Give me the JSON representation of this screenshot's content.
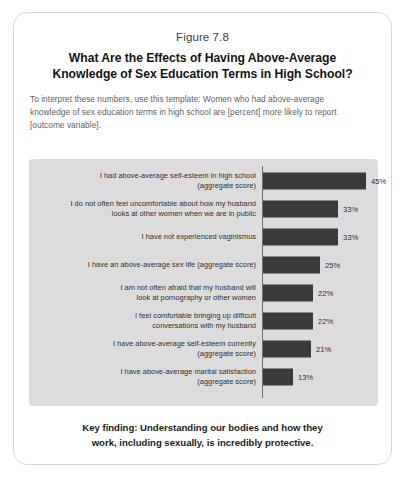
{
  "figure": {
    "number": "Figure 7.8",
    "title_lines": [
      "What Are the Effects of Having Above-Average",
      "Knowledge of Sex Education Terms in High School?"
    ],
    "description_lines": [
      "To interpret these numbers, use this template: Women who had above-average",
      "knowledge of sex education terms in high school are [percent] more likely to report",
      "[outcome variable]."
    ],
    "key_finding_lines": [
      "Key finding: Understanding our bodies and how they",
      "work, including sexually, is incredibly protective."
    ]
  },
  "colors": {
    "bar": "#3a3a3a",
    "panel_background": "#dcdcdc",
    "axis": "#6f6f6f",
    "card_border": "#d8d8d8"
  },
  "chart_data": {
    "type": "bar",
    "orientation": "horizontal",
    "title": "What Are the Effects of Having Above-Average Knowledge of Sex Education Terms in High School?",
    "xlabel": "",
    "ylabel": "",
    "xlim": [
      0,
      50
    ],
    "grid": false,
    "legend": null,
    "value_suffix": "%",
    "categories": [
      "I had above-average self-esteem in high school (aggregate score)",
      "I do not often feel uncomfortable about how my husband looks at other women when we are in public",
      "I have not experienced vaginismus",
      "I have an above-average sex life (aggregate score)",
      "I am not often afraid that my husband will look at pornography or other women",
      "I feel comfortable bringing up difficult conversations with my husband",
      "I have above-average self-esteem currently (aggregate score)",
      "I have above-average marital satisfaction (aggregate score)"
    ],
    "values": [
      45,
      33,
      33,
      25,
      22,
      22,
      21,
      13
    ],
    "rows": [
      {
        "label_lines": [
          "I had above-average self-esteem in high school",
          "(aggregate score)"
        ],
        "value": 45,
        "value_label": "45%"
      },
      {
        "label_lines": [
          "I do not often feel uncomfortable about how my husband",
          "looks at other women when we are in public"
        ],
        "value": 33,
        "value_label": "33%"
      },
      {
        "label_lines": [
          "I have not experienced vaginismus"
        ],
        "value": 33,
        "value_label": "33%"
      },
      {
        "label_lines": [
          "I have an above-average sex life (aggregate score)"
        ],
        "value": 25,
        "value_label": "25%"
      },
      {
        "label_lines": [
          "I am not often afraid that my husband will",
          "look at pornography or other women"
        ],
        "value": 22,
        "value_label": "22%"
      },
      {
        "label_lines": [
          "I feel comfortable bringing up difficult",
          "conversations with my husband"
        ],
        "value": 22,
        "value_label": "22%"
      },
      {
        "label_lines": [
          "I have above-average self-esteem currently",
          "(aggregate score)"
        ],
        "value": 21,
        "value_label": "21%"
      },
      {
        "label_lines": [
          "I have above-average marital satisfaction",
          "(aggregate score)"
        ],
        "value": 13,
        "value_label": "13%"
      }
    ]
  }
}
